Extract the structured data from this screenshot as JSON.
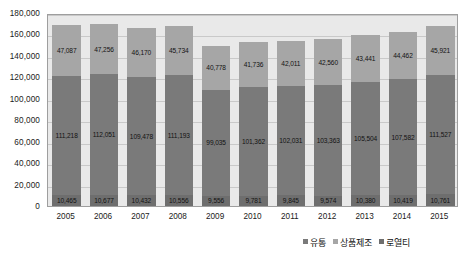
{
  "chart_data": {
    "type": "bar",
    "subtype": "stacked-bar",
    "title": "",
    "xlabel": "",
    "ylabel": "",
    "ylim": [
      0,
      180000
    ],
    "ytick_step": 20000,
    "grid": true,
    "legend_position": "bottom-right",
    "categories": [
      "2005",
      "2006",
      "2007",
      "2008",
      "2009",
      "2010",
      "2011",
      "2012",
      "2013",
      "2014",
      "2015"
    ],
    "yticks": [
      "0",
      "20,000",
      "40,000",
      "60,000",
      "80,000",
      "100,000",
      "120,000",
      "140,000",
      "160,000",
      "180,000"
    ],
    "ytick_values": [
      0,
      20000,
      40000,
      60000,
      80000,
      100000,
      120000,
      140000,
      160000,
      180000
    ],
    "series": [
      {
        "name": "로열티",
        "color": "#6e6e6e",
        "stack_order": 0,
        "values": [
          10465,
          10677,
          10432,
          10556,
          9556,
          9781,
          9845,
          9574,
          10380,
          10419,
          10761
        ],
        "labels": [
          "10,465",
          "10,677",
          "10,432",
          "10,556",
          "9,556",
          "9,781",
          "9,845",
          "9,574",
          "10,380",
          "10,419",
          "10,761"
        ]
      },
      {
        "name": "유통",
        "color": "#7a7a7a",
        "stack_order": 1,
        "values": [
          111218,
          112051,
          109478,
          111193,
          99035,
          101362,
          102031,
          103363,
          105504,
          107582,
          111527
        ],
        "labels": [
          "111,218",
          "112,051",
          "109,478",
          "111,193",
          "99,035",
          "101,362",
          "102,031",
          "103,363",
          "105,504",
          "107,582",
          "111,527"
        ]
      },
      {
        "name": "상품제조",
        "color": "#a6a6a6",
        "stack_order": 2,
        "values": [
          47087,
          47256,
          46170,
          45734,
          40778,
          41736,
          42011,
          42560,
          43441,
          44462,
          45921
        ],
        "labels": [
          "47,087",
          "47,256",
          "46,170",
          "45,734",
          "40,778",
          "41,736",
          "42,011",
          "42,560",
          "43,441",
          "44,462",
          "45,921"
        ]
      }
    ]
  },
  "legend": {
    "items": [
      {
        "label": "유통",
        "color": "#7a7a7a"
      },
      {
        "label": "상품제조",
        "color": "#a6a6a6"
      },
      {
        "label": "로열티",
        "color": "#6e6e6e"
      }
    ]
  }
}
